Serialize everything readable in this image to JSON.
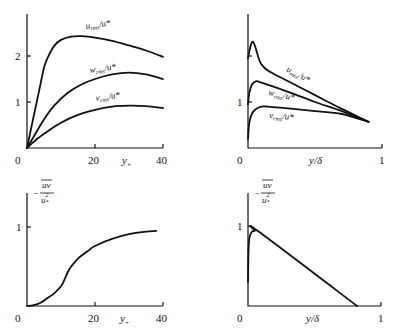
{
  "chart_data": [
    {
      "id": "top-left",
      "type": "line",
      "title": "",
      "xlabel": "y+",
      "ylabel": "",
      "xlim": [
        0,
        40
      ],
      "ylim": [
        0,
        2.8
      ],
      "x_ticks": [
        "0",
        "20",
        "40"
      ],
      "y_ticks": [
        "1",
        "2"
      ],
      "grid": false,
      "series": [
        {
          "name": "u_rms/u*",
          "label_main": "u",
          "label_sub": "rms",
          "label_tail": "/u*",
          "x": [
            0,
            2,
            4,
            5,
            6,
            8,
            10,
            13,
            16,
            20,
            25,
            30,
            35,
            40
          ],
          "values": [
            0,
            0.7,
            1.4,
            1.75,
            1.95,
            2.22,
            2.35,
            2.42,
            2.43,
            2.4,
            2.33,
            2.23,
            2.12,
            1.98
          ]
        },
        {
          "name": "w_rms/u*",
          "label_main": "w",
          "label_sub": "rms",
          "label_tail": "/u*",
          "x": [
            0,
            2,
            5,
            8,
            12,
            16,
            20,
            25,
            30,
            35,
            40
          ],
          "values": [
            0,
            0.25,
            0.62,
            0.92,
            1.2,
            1.38,
            1.5,
            1.6,
            1.64,
            1.6,
            1.5
          ]
        },
        {
          "name": "v_rms/u*",
          "label_main": "v",
          "label_sub": "rms",
          "label_tail": "/u*",
          "x": [
            0,
            3,
            6,
            10,
            15,
            20,
            25,
            30,
            35,
            40
          ],
          "values": [
            0,
            0.2,
            0.36,
            0.55,
            0.72,
            0.83,
            0.9,
            0.92,
            0.91,
            0.87
          ]
        }
      ]
    },
    {
      "id": "top-right",
      "type": "line",
      "title": "",
      "xlabel": "y/δ",
      "ylabel": "",
      "xlim": [
        0,
        1
      ],
      "ylim": [
        0,
        2.8
      ],
      "x_ticks": [
        "0",
        "1"
      ],
      "y_ticks": [
        "1"
      ],
      "grid": false,
      "series": [
        {
          "name": "u_rms/u*",
          "label_main": "u",
          "label_sub": "rms",
          "label_tail": "/u*",
          "x": [
            0,
            0.01,
            0.025,
            0.04,
            0.06,
            0.08,
            0.1,
            0.15,
            0.3,
            0.5,
            0.7,
            0.9
          ],
          "values": [
            1.95,
            2.1,
            2.27,
            2.3,
            2.15,
            1.95,
            1.82,
            1.68,
            1.45,
            1.15,
            0.85,
            0.57
          ]
        },
        {
          "name": "w_rms/u*",
          "label_main": "w",
          "label_sub": "rms",
          "label_tail": "/u*",
          "x": [
            0,
            0.01,
            0.03,
            0.06,
            0.1,
            0.3,
            0.5,
            0.7,
            0.9
          ],
          "values": [
            0.95,
            1.2,
            1.38,
            1.45,
            1.42,
            1.22,
            1.0,
            0.8,
            0.57
          ]
        },
        {
          "name": "v_rms/u*",
          "label_main": "v",
          "label_sub": "rms",
          "label_tail": "/u*",
          "x": [
            0,
            0.01,
            0.03,
            0.06,
            0.1,
            0.15,
            0.3,
            0.5,
            0.7,
            0.9
          ],
          "values": [
            0.2,
            0.55,
            0.75,
            0.85,
            0.9,
            0.9,
            0.86,
            0.8,
            0.74,
            0.57
          ]
        }
      ]
    },
    {
      "id": "bottom-left",
      "type": "line",
      "title": "",
      "xlabel": "y+",
      "ylabel": "-uv/u*²",
      "xlim": [
        0,
        40
      ],
      "ylim": [
        0,
        1.5
      ],
      "x_ticks": [
        "0",
        "20",
        "40"
      ],
      "y_ticks": [
        "1"
      ],
      "grid": false,
      "series": [
        {
          "name": "-uv/u*^2",
          "x": [
            0,
            2,
            4,
            6,
            8,
            10,
            11,
            12,
            13,
            15,
            18,
            20,
            25,
            30,
            35,
            38
          ],
          "values": [
            0,
            0.01,
            0.04,
            0.1,
            0.16,
            0.25,
            0.33,
            0.43,
            0.5,
            0.6,
            0.7,
            0.76,
            0.85,
            0.91,
            0.94,
            0.95
          ]
        }
      ]
    },
    {
      "id": "bottom-right",
      "type": "line",
      "title": "",
      "xlabel": "y/δ",
      "ylabel": "-uv/u*²",
      "xlim": [
        0,
        1
      ],
      "ylim": [
        0,
        1.5
      ],
      "x_ticks": [
        "0",
        "1"
      ],
      "y_ticks": [
        "1"
      ],
      "grid": false,
      "series": [
        {
          "name": "-uv/u*^2",
          "x": [
            0,
            0.005,
            0.015,
            0.03,
            0.05,
            0.08,
            0.82
          ],
          "values": [
            0.3,
            0.75,
            0.88,
            0.93,
            0.94,
            0.93,
            0
          ]
        }
      ]
    }
  ],
  "labels": {
    "zero": "0",
    "yplus_main": "y",
    "yplus_sub": "+",
    "ydelta": "y/δ",
    "uv_minus": "−",
    "uv_num": "uv",
    "uv_den_main": "u",
    "uv_den_sub": "*",
    "uv_den_sup": "2"
  }
}
